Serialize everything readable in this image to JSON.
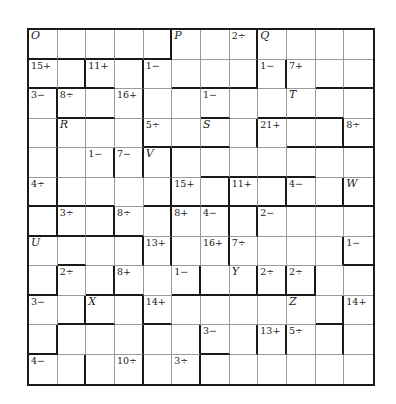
{
  "puzzle": {
    "type": "kenken",
    "size": 12,
    "labels": [
      {
        "r": 0,
        "c": 0,
        "t": "O",
        "letter": true
      },
      {
        "r": 0,
        "c": 5,
        "t": "P",
        "letter": true
      },
      {
        "r": 0,
        "c": 7,
        "t": "2÷"
      },
      {
        "r": 0,
        "c": 8,
        "t": "Q",
        "letter": true
      },
      {
        "r": 1,
        "c": 0,
        "t": "15+"
      },
      {
        "r": 1,
        "c": 2,
        "t": "11+"
      },
      {
        "r": 1,
        "c": 4,
        "t": "1−"
      },
      {
        "r": 1,
        "c": 8,
        "t": "1−"
      },
      {
        "r": 1,
        "c": 9,
        "t": "7+"
      },
      {
        "r": 2,
        "c": 0,
        "t": "3−"
      },
      {
        "r": 2,
        "c": 1,
        "t": "8÷"
      },
      {
        "r": 2,
        "c": 3,
        "t": "16+"
      },
      {
        "r": 2,
        "c": 6,
        "t": "1−"
      },
      {
        "r": 2,
        "c": 9,
        "t": "T",
        "letter": true
      },
      {
        "r": 3,
        "c": 1,
        "t": "R",
        "letter": true
      },
      {
        "r": 3,
        "c": 4,
        "t": "5÷"
      },
      {
        "r": 3,
        "c": 6,
        "t": "S",
        "letter": true
      },
      {
        "r": 3,
        "c": 8,
        "t": "21+"
      },
      {
        "r": 3,
        "c": 11,
        "t": "8÷"
      },
      {
        "r": 4,
        "c": 2,
        "t": "1−"
      },
      {
        "r": 4,
        "c": 3,
        "t": "7−"
      },
      {
        "r": 4,
        "c": 4,
        "t": "V",
        "letter": true
      },
      {
        "r": 5,
        "c": 0,
        "t": "4÷"
      },
      {
        "r": 5,
        "c": 5,
        "t": "15+"
      },
      {
        "r": 5,
        "c": 7,
        "t": "11+"
      },
      {
        "r": 5,
        "c": 9,
        "t": "4−"
      },
      {
        "r": 5,
        "c": 11,
        "t": "W",
        "letter": true
      },
      {
        "r": 6,
        "c": 1,
        "t": "3÷"
      },
      {
        "r": 6,
        "c": 3,
        "t": "8÷"
      },
      {
        "r": 6,
        "c": 5,
        "t": "8+"
      },
      {
        "r": 6,
        "c": 6,
        "t": "4−"
      },
      {
        "r": 6,
        "c": 8,
        "t": "2−"
      },
      {
        "r": 7,
        "c": 0,
        "t": "U",
        "letter": true
      },
      {
        "r": 7,
        "c": 4,
        "t": "13+"
      },
      {
        "r": 7,
        "c": 6,
        "t": "16+"
      },
      {
        "r": 7,
        "c": 7,
        "t": "7÷"
      },
      {
        "r": 7,
        "c": 11,
        "t": "1−"
      },
      {
        "r": 8,
        "c": 1,
        "t": "2÷"
      },
      {
        "r": 8,
        "c": 3,
        "t": "8+"
      },
      {
        "r": 8,
        "c": 5,
        "t": "1−"
      },
      {
        "r": 8,
        "c": 7,
        "t": "Y",
        "letter": true
      },
      {
        "r": 8,
        "c": 8,
        "t": "2÷"
      },
      {
        "r": 8,
        "c": 9,
        "t": "2÷"
      },
      {
        "r": 9,
        "c": 0,
        "t": "3−"
      },
      {
        "r": 9,
        "c": 2,
        "t": "X",
        "letter": true
      },
      {
        "r": 9,
        "c": 4,
        "t": "14+"
      },
      {
        "r": 9,
        "c": 9,
        "t": "Z",
        "letter": true
      },
      {
        "r": 9,
        "c": 11,
        "t": "14+"
      },
      {
        "r": 10,
        "c": 6,
        "t": "3−"
      },
      {
        "r": 10,
        "c": 8,
        "t": "13+"
      },
      {
        "r": 10,
        "c": 9,
        "t": "5÷"
      },
      {
        "r": 11,
        "c": 0,
        "t": "4−"
      },
      {
        "r": 11,
        "c": 3,
        "t": "10÷"
      },
      {
        "r": 11,
        "c": 5,
        "t": "3÷"
      }
    ],
    "thick_right": [
      "000010010000",
      "010100011001",
      "100100000000",
      "100100010010",
      "101110000000",
      "100010101010",
      "101010110000",
      "000110100010",
      "101001011100",
      "010100000010",
      "100101011010",
      "010101000000"
    ],
    "thick_bottom": [
      "111110000000",
      "111001110011",
      "011000101110",
      "000011100111",
      "000000111100",
      "111011111111",
      "111100000000",
      "010000000001",
      "101101111100",
      "011010000010",
      "100000100000",
      "000000000000"
    ]
  }
}
